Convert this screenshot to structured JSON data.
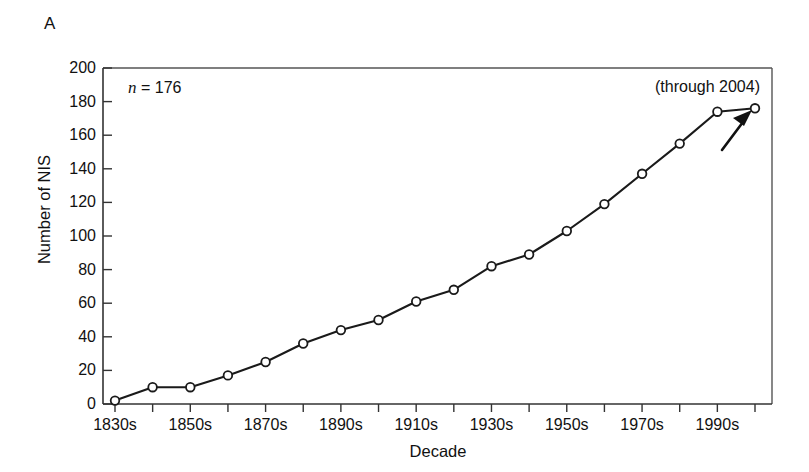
{
  "figure": {
    "panel_letter": "A",
    "annotation_n": "n = 176",
    "annotation_n_symbol": "n",
    "annotation_n_value": " = 176",
    "annotation_through": "(through 2004)"
  },
  "chart_data": {
    "type": "line",
    "title": "",
    "xlabel": "Decade",
    "ylabel": "Number of NIS",
    "xlim": [
      "1830s",
      "2000s"
    ],
    "ylim": [
      0,
      200
    ],
    "ytick_step": 20,
    "yticks": [
      0,
      20,
      40,
      60,
      80,
      100,
      120,
      140,
      160,
      180,
      200
    ],
    "ytick_labels": [
      "0",
      "20",
      "40",
      "60",
      "80",
      "100",
      "120",
      "140",
      "160",
      "180",
      "200"
    ],
    "categories": [
      "1830s",
      "1840s",
      "1850s",
      "1860s",
      "1870s",
      "1880s",
      "1890s",
      "1900s",
      "1910s",
      "1920s",
      "1930s",
      "1940s",
      "1950s",
      "1960s",
      "1970s",
      "1980s",
      "1990s",
      "2000s"
    ],
    "xtick_labels_shown": [
      "1830s",
      "",
      "1850s",
      "",
      "1870s",
      "",
      "1890s",
      "",
      "1910s",
      "",
      "1930s",
      "",
      "1950s",
      "",
      "1970s",
      "",
      "1990s",
      ""
    ],
    "values": [
      2,
      10,
      10,
      17,
      25,
      36,
      44,
      50,
      61,
      68,
      82,
      89,
      103,
      119,
      137,
      155,
      174,
      176
    ],
    "marker": "open-circle",
    "marker_face_color": "#ffffff",
    "line_color": "#1a1a1a",
    "grid": false,
    "legend": null,
    "annotations": [
      {
        "text": "n = 176",
        "position": "top-left-inside"
      },
      {
        "text": "(through 2004)",
        "position": "top-right-inside"
      },
      {
        "text": "",
        "type": "arrow",
        "points_to": "2000s",
        "position": "below-right-of-last-point"
      }
    ]
  }
}
